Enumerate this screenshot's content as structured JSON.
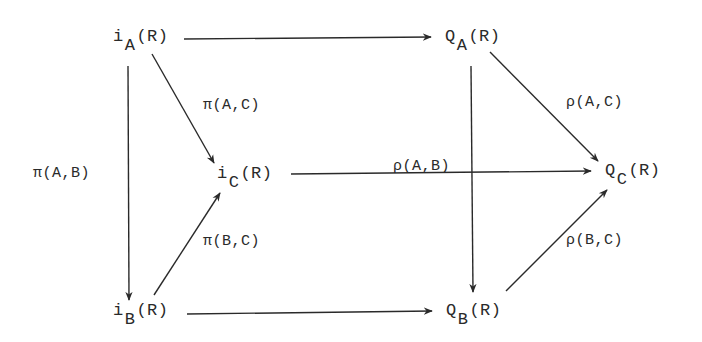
{
  "diagram": {
    "type": "commutative-diagram",
    "nodes": {
      "iA": {
        "base": "i",
        "sub": "A",
        "arg": "(R)"
      },
      "QA": {
        "base": "Q",
        "sub": "A",
        "arg": "(R)"
      },
      "iC": {
        "base": "i",
        "sub": "C",
        "arg": "(R)"
      },
      "QC": {
        "base": "Q",
        "sub": "C",
        "arg": "(R)"
      },
      "iB": {
        "base": "i",
        "sub": "B",
        "arg": "(R)"
      },
      "QB": {
        "base": "Q",
        "sub": "B",
        "arg": "(R)"
      }
    },
    "edges": [
      {
        "from": "iA",
        "to": "QA",
        "label": ""
      },
      {
        "from": "iA",
        "to": "iC",
        "label": "π(A,C)"
      },
      {
        "from": "iA",
        "to": "iB",
        "label": "π(A,B)"
      },
      {
        "from": "iB",
        "to": "iC",
        "label": "π(B,C)"
      },
      {
        "from": "iB",
        "to": "QB",
        "label": ""
      },
      {
        "from": "iC",
        "to": "QC",
        "label": ""
      },
      {
        "from": "QA",
        "to": "QC",
        "label": "ρ(A,C)"
      },
      {
        "from": "QA",
        "to": "QB",
        "label": "ρ(A,B)"
      },
      {
        "from": "QB",
        "to": "QC",
        "label": "ρ(B,C)"
      }
    ],
    "labels": {
      "pi_AC": "π(A,C)",
      "pi_AB": "π(A,B)",
      "pi_BC": "π(B,C)",
      "rho_AC": "ρ(A,C)",
      "rho_AB": "ρ(A,B)",
      "rho_BC": "ρ(B,C)"
    },
    "colors": {
      "ink": "#2a2a2a",
      "background": "#ffffff"
    }
  }
}
